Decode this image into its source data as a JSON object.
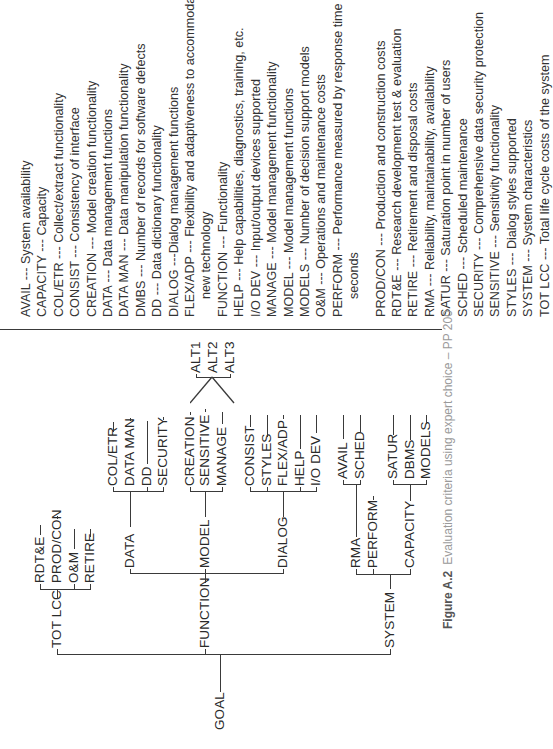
{
  "diagram": {
    "root": "GOAL",
    "level1": [
      "TOT LCC",
      "FUNCTION",
      "SYSTEM"
    ],
    "tot_lcc_children": [
      "RDT&E",
      "PROD/CON",
      "O&M",
      "RETIRE"
    ],
    "function_children": [
      "DATA",
      "MODEL",
      "DIALOG"
    ],
    "data_children": [
      "COL/ETR",
      "DATA MAN",
      "DD",
      "SECURITY"
    ],
    "model_children": [
      "CREATION",
      "SENSITIVE",
      "MANAGE"
    ],
    "dialog_children": [
      "CONSIST",
      "STYLES",
      "FLEX/ADP",
      "HELP",
      "I/O DEV"
    ],
    "system_children": [
      "RMA",
      "PERFORM",
      "CAPACITY"
    ],
    "rma_children": [
      "AVAIL",
      "SCHED"
    ],
    "capacity_children": [
      "SATUR",
      "DBMS",
      "MODELS"
    ],
    "alternatives": [
      "ALT1",
      "ALT2",
      "ALT3"
    ]
  },
  "legend": [
    {
      "abbr": "AVAIL",
      "def": "--- System availability"
    },
    {
      "abbr": "CAPACITY",
      "def": "--- Capacity"
    },
    {
      "abbr": "COL/ETR",
      "def": "--- Collect/extract functionality"
    },
    {
      "abbr": "CONSIST",
      "def": "--- Consistency of interface"
    },
    {
      "abbr": "CREATION",
      "def": "--- Model creation functionality"
    },
    {
      "abbr": "DATA",
      "def": "--- Data management functions"
    },
    {
      "abbr": "DATA MAN",
      "def": "--- Data manipulation functionality"
    },
    {
      "abbr": "DMBS",
      "def": "--- Number of records for software defects"
    },
    {
      "abbr": "DD",
      "def": "--- Data dictionary functionality"
    },
    {
      "abbr": "DIALOG",
      "def": "---Dialog management functions"
    },
    {
      "abbr": "FLEX/ADP",
      "def": "--- Flexibility and adaptiveness to accommodate",
      "cont": "new technology"
    },
    {
      "abbr": "FUNCTION",
      "def": "--- Functionality"
    },
    {
      "abbr": "HELP",
      "def": "--- Help capabilities, diagnostics, training, etc."
    },
    {
      "abbr": "I/O DEV",
      "def": "--- Input/output devices supported"
    },
    {
      "abbr": "MANAGE",
      "def": "--- Model management functionality"
    },
    {
      "abbr": "MODEL",
      "def": "--- Model management functions"
    },
    {
      "abbr": "MODELS",
      "def": "--- Number of decision support models"
    },
    {
      "abbr": "O&M",
      "def": "--- Operations and maintenance costs"
    },
    {
      "abbr": "PERFORM",
      "def": "--- Performance measured by response time in",
      "cont": "seconds"
    },
    {
      "abbr": "PROD/CON",
      "def": "--- Production and construction costs"
    },
    {
      "abbr": "RDT&E",
      "def": "--- Research development test & evaluation"
    },
    {
      "abbr": "RETIRE",
      "def": "--- Retirement and disposal costs"
    },
    {
      "abbr": "RMA",
      "def": "--- Reliability, maintainability, availability"
    },
    {
      "abbr": "SATUR",
      "def": "--- Saturation point in number of users"
    },
    {
      "abbr": "SCHED",
      "def": "--- Scheduled maintenance"
    },
    {
      "abbr": "SECURITY",
      "def": "--- Comprehensive data security protection"
    },
    {
      "abbr": "SENSITIVE",
      "def": "--- Sensitivity functionality"
    },
    {
      "abbr": "STYLES",
      "def": "--- Dialog styles supported"
    },
    {
      "abbr": "SYSTEM",
      "def": "--- System characteristics"
    },
    {
      "abbr": "TOT LCC",
      "def": "--- Total life cycle costs of the system"
    }
  ],
  "caption": {
    "label": "Figure A.2",
    "text": "Evaluation criteria using expert choice – PP 200"
  }
}
